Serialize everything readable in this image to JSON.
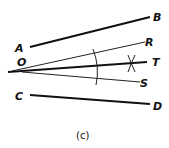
{
  "diagram": {
    "caption": "(c)",
    "labels": {
      "A": "A",
      "B": "B",
      "O": "O",
      "R": "R",
      "T": "T",
      "S": "S",
      "C": "C",
      "D": "D"
    },
    "lines": [
      {
        "name": "AB",
        "from": "A",
        "to": "B",
        "weight": "thick"
      },
      {
        "name": "OR",
        "from": "O",
        "to": "R",
        "weight": "thin"
      },
      {
        "name": "OT",
        "from": "O",
        "to": "T",
        "weight": "thick"
      },
      {
        "name": "OS",
        "from": "O",
        "to": "S",
        "weight": "thin"
      },
      {
        "name": "CD",
        "from": "C",
        "to": "D",
        "weight": "thick"
      }
    ],
    "construction": [
      "arc across OR and OS",
      "intersecting arcs mark on OT"
    ]
  }
}
